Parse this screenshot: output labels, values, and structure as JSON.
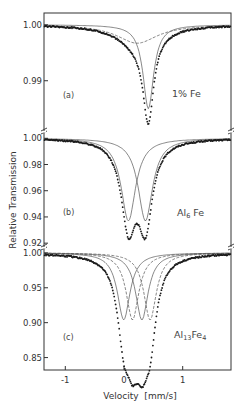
{
  "chart_data": {
    "type": "line",
    "title": "",
    "xlabel": "Velocity  [mm/s]",
    "ylabel": "Relative Transmission",
    "xlim": [
      -1.37,
      1.82
    ],
    "x_ticks": [
      -1,
      0,
      1
    ],
    "x_tick_labels": [
      "-1",
      "0",
      "1"
    ],
    "grid": false,
    "legend": null,
    "panels": [
      {
        "id": "a",
        "panel_label": "(a)",
        "sample_label": "1% Fe",
        "ylim": [
          0.9812,
          1.0021
        ],
        "y_ticks": [
          1.0,
          0.99
        ],
        "y_tick_labels": [
          "1.00",
          "0.99"
        ],
        "series": [
          {
            "name": "data",
            "style": "points",
            "x": [
              -1.3,
              -1.0,
              -0.7,
              -0.4,
              -0.2,
              0.0,
              0.1,
              0.2,
              0.3,
              0.35,
              0.41,
              0.47,
              0.55,
              0.7,
              0.9,
              1.2,
              1.5,
              1.8
            ],
            "y": [
              1.0,
              0.9998,
              0.9994,
              0.9982,
              0.9965,
              0.9945,
              0.9925,
              0.9895,
              0.9855,
              0.9835,
              0.9818,
              0.9845,
              0.9905,
              0.996,
              0.9985,
              0.9995,
              0.9998,
              1.0001
            ]
          },
          {
            "name": "fit-narrow",
            "style": "thin-line",
            "center": 0.41,
            "depth": 0.015,
            "hwhm": 0.11
          },
          {
            "name": "fit-broad",
            "style": "dashed-line",
            "center": 0.22,
            "depth": 0.0033,
            "hwhm": 0.42
          }
        ]
      },
      {
        "id": "b",
        "panel_label": "(b)",
        "sample_label": "Al6 Fe",
        "ylim": [
          0.9186,
          1.0048
        ],
        "y_ticks": [
          1.0,
          0.98,
          0.96,
          0.94,
          0.92
        ],
        "y_tick_labels": [
          "1.00",
          "0.98",
          "0.96",
          "0.94",
          "0.92"
        ],
        "series": [
          {
            "name": "data",
            "style": "points",
            "x": [
              -1.3,
              -1.0,
              -0.7,
              -0.4,
              -0.2,
              -0.05,
              0.07,
              0.16,
              0.22,
              0.36,
              0.45,
              0.6,
              0.8,
              1.1,
              1.4,
              1.8
            ],
            "y": [
              1.0,
              0.999,
              0.997,
              0.99,
              0.978,
              0.955,
              0.9245,
              0.94,
              0.943,
              0.922,
              0.94,
              0.97,
              0.988,
              0.997,
              0.999,
              1.002
            ]
          },
          {
            "name": "fit-line-1",
            "style": "thin-line",
            "center": 0.07,
            "depth": 0.063,
            "hwhm": 0.15
          },
          {
            "name": "fit-line-2",
            "style": "thin-line",
            "center": 0.36,
            "depth": 0.063,
            "hwhm": 0.15
          }
        ]
      },
      {
        "id": "c",
        "panel_label": "(c)",
        "sample_label": "Al13 Fe4",
        "ylim": [
          0.8322,
          1.0084
        ],
        "y_ticks": [
          1.0,
          0.95,
          0.9,
          0.85
        ],
        "y_tick_labels": [
          "1.00",
          "0.95",
          "0.90",
          "0.85"
        ],
        "series": [
          {
            "name": "data",
            "style": "points",
            "x": [
              -1.3,
              -1.0,
              -0.7,
              -0.4,
              -0.2,
              -0.05,
              0.0,
              0.1,
              0.15,
              0.22,
              0.3,
              0.38,
              0.45,
              0.55,
              0.7,
              1.0,
              1.4,
              1.8
            ],
            "y": [
              1.0,
              0.999,
              0.997,
              0.985,
              0.96,
              0.9,
              0.872,
              0.858,
              0.85,
              0.862,
              0.861,
              0.87,
              0.905,
              0.95,
              0.985,
              0.997,
              0.999,
              1.001
            ]
          },
          {
            "name": "fit-doublet-1-line-a",
            "style": "thin-line",
            "center": -0.01,
            "depth": 0.096,
            "hwhm": 0.13
          },
          {
            "name": "fit-doublet-1-line-b",
            "style": "thin-line",
            "center": 0.3,
            "depth": 0.096,
            "hwhm": 0.13
          },
          {
            "name": "fit-doublet-2-line-a",
            "style": "dashed-line",
            "center": 0.14,
            "depth": 0.096,
            "hwhm": 0.13
          },
          {
            "name": "fit-doublet-2-line-b",
            "style": "dashed-line",
            "center": 0.44,
            "depth": 0.096,
            "hwhm": 0.13
          }
        ]
      }
    ]
  },
  "labels": {
    "y_axis_title": "Relative Transmission",
    "x_axis_title": "Velocity  [mm/s]",
    "panel_a": {
      "tag": "(a)",
      "sample": "1% Fe",
      "ticks": [
        "1.00",
        "0.99"
      ]
    },
    "panel_b": {
      "tag": "(b)",
      "sample_main": "Al",
      "sample_sub": "6",
      "sample_tail": " Fe",
      "ticks": [
        "1.00",
        "0.98",
        "0.96",
        "0.94",
        "0.92"
      ]
    },
    "panel_c": {
      "tag": "(c)",
      "sample_main": "Al",
      "sample_sub1": "13",
      "sample_mid": "Fe",
      "sample_sub2": "4",
      "ticks": [
        "1.00",
        "0.95",
        "0.90",
        "0.85"
      ]
    },
    "x_ticks": [
      "-1",
      "0",
      "1"
    ]
  },
  "colors": {
    "ink": "#1a1a1a",
    "fit": "#555555",
    "background": "#ffffff"
  }
}
